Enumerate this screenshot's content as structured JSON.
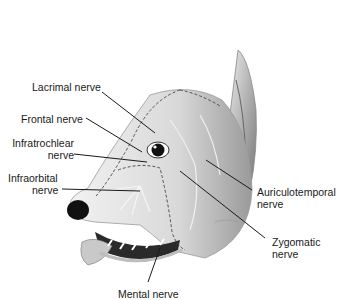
{
  "figure": {
    "labels": [
      {
        "id": "lacrimal",
        "text": "Lacrimal nerve"
      },
      {
        "id": "frontal",
        "text": "Frontal nerve"
      },
      {
        "id": "infratrochlear",
        "line1": "Infratrochlear",
        "line2": "nerve"
      },
      {
        "id": "infraorbital",
        "line1": "Infraorbital",
        "line2": "nerve"
      },
      {
        "id": "auriculotemporal",
        "line1": "Auriculotemporal",
        "line2": "nerve"
      },
      {
        "id": "zygomatic",
        "line1": "Zygomatic",
        "line2": "nerve"
      },
      {
        "id": "mental",
        "text": "Mental nerve"
      }
    ],
    "colors": {
      "background": "#ffffff",
      "text": "#1a1a1a",
      "leader": "#1a1a1a",
      "nose": "#111111"
    }
  }
}
